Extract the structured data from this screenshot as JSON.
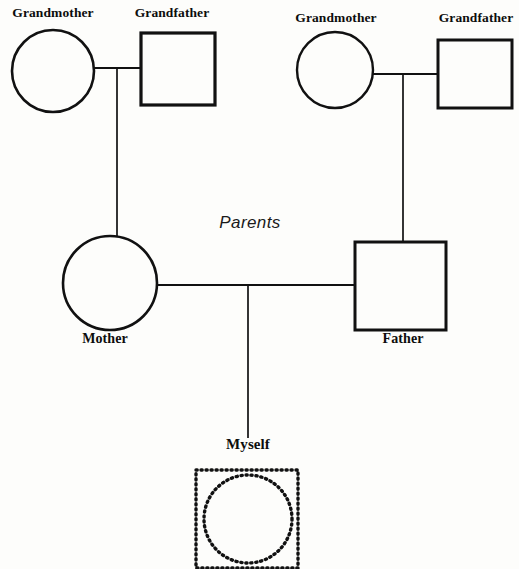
{
  "diagram": {
    "type": "genogram",
    "palette": {
      "background": "#fdfdfb",
      "stroke": "#111111",
      "text": "#0d0d0d"
    },
    "group_labels": [
      {
        "id": "parents",
        "text": "Parents",
        "x": 248,
        "y": 225
      }
    ],
    "nodes": [
      {
        "id": "maternal-grandmother",
        "label": "Grandmother",
        "shape": "circle",
        "generation": 1,
        "side": "maternal",
        "cx": 53,
        "cy": 71,
        "r": 41,
        "stroke_width": 2.6,
        "label_x": 53,
        "label_y": 14
      },
      {
        "id": "maternal-grandfather",
        "label": "Grandfather",
        "shape": "square",
        "generation": 1,
        "side": "maternal",
        "x": 141,
        "y": 33,
        "w": 74,
        "h": 72,
        "stroke_width": 3.2,
        "label_x": 170,
        "label_y": 14
      },
      {
        "id": "paternal-grandmother",
        "label": "Grandmother",
        "shape": "circle",
        "generation": 1,
        "side": "paternal",
        "cx": 335,
        "cy": 70,
        "r": 38,
        "stroke_width": 2.4,
        "label_x": 335,
        "label_y": 19
      },
      {
        "id": "paternal-grandfather",
        "label": "Grandfather",
        "shape": "square",
        "generation": 1,
        "side": "paternal",
        "x": 438,
        "y": 40,
        "w": 74,
        "h": 68,
        "stroke_width": 3.0,
        "label_x": 475,
        "label_y": 19
      },
      {
        "id": "mother",
        "label": "Mother",
        "shape": "circle",
        "generation": 2,
        "side": "maternal",
        "cx": 110,
        "cy": 283,
        "r": 47,
        "stroke_width": 2.6,
        "label_x": 105,
        "label_y": 338
      },
      {
        "id": "father",
        "label": "Father",
        "shape": "square",
        "generation": 2,
        "side": "paternal",
        "x": 355,
        "y": 242,
        "w": 91,
        "h": 88,
        "stroke_width": 3.0,
        "label_x": 402,
        "label_y": 337
      },
      {
        "id": "myself",
        "label": "Myself",
        "shape": "square-and-circle-dotted",
        "generation": 3,
        "side": "self",
        "x": 196,
        "y": 470,
        "w": 102,
        "h": 98,
        "cx": 248,
        "cy": 519,
        "r": 44,
        "stroke_width": 3.2,
        "dash": "1 4",
        "label_x": 248,
        "label_y": 441
      }
    ],
    "unions": [
      {
        "id": "maternal-grandparents-union",
        "partners": [
          "maternal-grandmother",
          "maternal-grandfather"
        ],
        "line_y": 68,
        "x_from": 94,
        "x_to": 141,
        "descent_x": 117,
        "descent_from": 68,
        "descent_to": 236,
        "child": "mother"
      },
      {
        "id": "paternal-grandparents-union",
        "partners": [
          "paternal-grandmother",
          "paternal-grandfather"
        ],
        "line_y": 74,
        "x_from": 373,
        "x_to": 438,
        "descent_x": 403,
        "descent_from": 74,
        "descent_to": 242,
        "child": "father"
      },
      {
        "id": "parents-union",
        "partners": [
          "mother",
          "father"
        ],
        "line_y": 285,
        "x_from": 157,
        "x_to": 355,
        "descent_x": 248,
        "descent_from": 286,
        "descent_to": 438,
        "child": "myself"
      }
    ]
  }
}
